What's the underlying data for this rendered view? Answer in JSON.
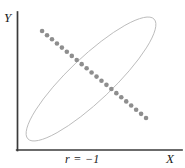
{
  "figure": {
    "background_color": "#ffffff",
    "width": 185,
    "height": 168
  },
  "axes": {
    "color": "#3a3a3a",
    "line_width": 1.6,
    "y_axis": {
      "label": "Y",
      "x": 17,
      "y_top": 12,
      "y_bottom": 150
    },
    "x_axis": {
      "label": "X",
      "y": 150,
      "x_left": 17,
      "x_right": 182
    }
  },
  "annotation": {
    "name": "correlation-coefficient",
    "text": "r = −1",
    "value": -1
  },
  "style": {
    "point_color": "#8e8e8e",
    "point_radius": 2.3,
    "ellipse_stroke": "#b9b9b9",
    "ellipse_stroke_width": 0.9
  },
  "chart_data": {
    "type": "scatter",
    "title": "",
    "subtitle": "",
    "xlabel": "X",
    "ylabel": "Y",
    "annotations": [
      "r = −1"
    ],
    "legend": [],
    "legend_position": "none",
    "grid": false,
    "axis_ticks": false,
    "xlim": [
      0,
      1
    ],
    "ylim": [
      0,
      1
    ],
    "correlation": -1,
    "ellipse": {
      "center_x": 0.455,
      "center_y": 0.515,
      "semi_major": 0.49,
      "semi_minor": 0.12,
      "rotation_deg": -43.5
    },
    "series": [
      {
        "name": "observations",
        "marker": "circle",
        "color": "#8e8e8e",
        "n_points": 22,
        "x": [
          0.152,
          0.182,
          0.212,
          0.242,
          0.272,
          0.302,
          0.332,
          0.362,
          0.392,
          0.422,
          0.452,
          0.482,
          0.512,
          0.542,
          0.572,
          0.602,
          0.632,
          0.662,
          0.692,
          0.722,
          0.752,
          0.782
        ],
        "y": [
          0.862,
          0.832,
          0.802,
          0.772,
          0.742,
          0.712,
          0.682,
          0.652,
          0.622,
          0.592,
          0.562,
          0.532,
          0.502,
          0.472,
          0.442,
          0.412,
          0.382,
          0.352,
          0.322,
          0.292,
          0.262,
          0.232
        ]
      }
    ]
  }
}
